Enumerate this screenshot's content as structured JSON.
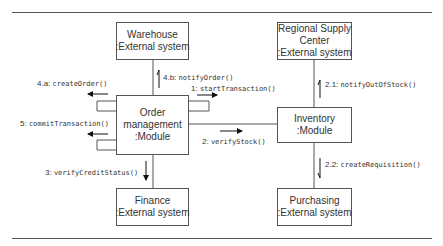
{
  "diagram": {
    "type": "UML communication diagram",
    "nodes": [
      {
        "id": "warehouse",
        "lines": [
          "Warehouse",
          ":External system"
        ]
      },
      {
        "id": "regional",
        "lines": [
          "Regional Supply",
          "Center",
          ":External system"
        ]
      },
      {
        "id": "order",
        "lines": [
          "Order",
          "management",
          ":Module"
        ]
      },
      {
        "id": "inventory",
        "lines": [
          "Inventory",
          ":Module"
        ]
      },
      {
        "id": "finance",
        "lines": [
          "Finance",
          ":External system"
        ]
      },
      {
        "id": "purchasing",
        "lines": [
          "Purchasing",
          ":External system"
        ]
      }
    ],
    "messages": [
      {
        "num": "4.a:",
        "call": "createOrder()",
        "from": "order",
        "to": "order"
      },
      {
        "num": "4.b:",
        "call": "notifyOrder()",
        "from": "order",
        "to": "warehouse"
      },
      {
        "num": "1:",
        "call": "startTransaction()",
        "from": "order",
        "to": "order"
      },
      {
        "num": "5:",
        "call": "commitTransaction()",
        "from": "order",
        "to": "order"
      },
      {
        "num": "2:",
        "call": "verifyStock()",
        "from": "order",
        "to": "inventory"
      },
      {
        "num": "3:",
        "call": "verifyCreditStatus()",
        "from": "order",
        "to": "finance"
      },
      {
        "num": "2.1:",
        "call": "notifyOutOfStock()",
        "from": "inventory",
        "to": "regional"
      },
      {
        "num": "2.2:",
        "call": "createRequisition()",
        "from": "inventory",
        "to": "purchasing"
      }
    ]
  }
}
